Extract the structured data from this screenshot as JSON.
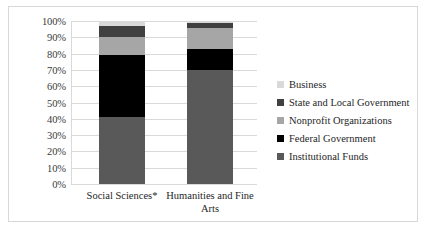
{
  "chart_data": {
    "type": "bar",
    "subtype": "stacked-percentage-column",
    "title": "",
    "xlabel": "",
    "ylabel": "",
    "ylim": [
      0,
      100
    ],
    "ytick_labels": [
      "100%",
      "90%",
      "80%",
      "70%",
      "60%",
      "50%",
      "40%",
      "30%",
      "20%",
      "10%",
      "0%"
    ],
    "ytick_values": [
      100,
      90,
      80,
      70,
      60,
      50,
      40,
      30,
      20,
      10,
      0
    ],
    "grid": true,
    "legend_position": "right",
    "categories": [
      "Social Sciences*",
      "Humanities and Fine Arts"
    ],
    "category_lines": [
      [
        "Social Sciences*"
      ],
      [
        "Humanities and Fine",
        "Arts"
      ]
    ],
    "series": [
      {
        "name": "Institutional Funds",
        "color": "#595959",
        "values": [
          41,
          70
        ]
      },
      {
        "name": "Federal Government",
        "color": "#000000",
        "values": [
          38,
          13
        ]
      },
      {
        "name": "Nonprofit Organizations",
        "color": "#a6a6a6",
        "values": [
          11,
          13
        ]
      },
      {
        "name": "State and Local Government",
        "color": "#404040",
        "values": [
          7,
          3
        ]
      },
      {
        "name": "Business",
        "color": "#d9d9d9",
        "values": [
          3,
          1
        ]
      }
    ],
    "stack_order_bottom_to_top": [
      "Institutional Funds",
      "Federal Government",
      "Nonprofit Organizations",
      "State and Local Government",
      "Business"
    ]
  },
  "legend": {
    "items": [
      {
        "label": "Business",
        "color": "#d9d9d9"
      },
      {
        "label": "State and Local Government",
        "color": "#404040"
      },
      {
        "label": "Nonprofit Organizations",
        "color": "#a6a6a6"
      },
      {
        "label": "Federal Government",
        "color": "#000000"
      },
      {
        "label": "Institutional Funds",
        "color": "#595959"
      }
    ]
  }
}
